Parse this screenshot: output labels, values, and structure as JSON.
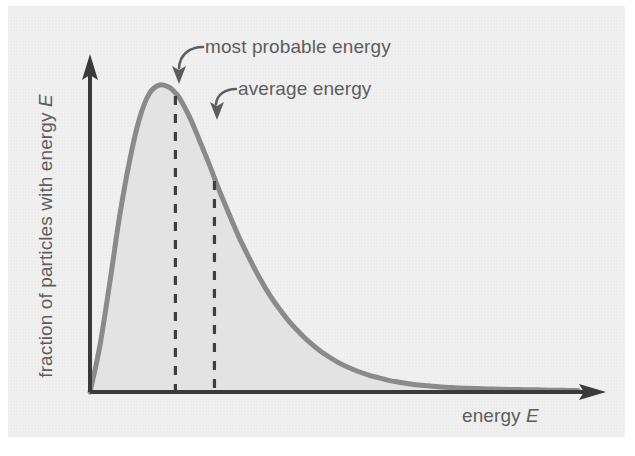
{
  "figure": {
    "kind": "maxwell-boltzmann-distribution-diagram",
    "background_color": "#eeeeee",
    "curve_color": "#8a8a8a",
    "fill_color": "#e3e3e3",
    "axis_color": "#3a3a3a",
    "annotation_color": "#5d5d5d",
    "dash_color": "#3f3f3f"
  },
  "axes": {
    "y_label_text": "fraction of particles with energy",
    "y_label_symbol": "E",
    "x_label_text": "energy",
    "x_label_symbol": "E",
    "y_arrow": "up-arrow-icon",
    "x_arrow": "right-arrow-icon"
  },
  "annotations": [
    {
      "id": "most-probable-energy",
      "label": "most probable energy",
      "arrow": "curved-leader-arrow-icon",
      "points_to": "peak-of-curve"
    },
    {
      "id": "average-energy",
      "label": "average energy",
      "arrow": "curved-leader-arrow-icon",
      "points_to": "average-energy-marker"
    }
  ],
  "markers": [
    {
      "id": "most-probable-marker",
      "style": "dashed-vertical-line"
    },
    {
      "id": "average-marker",
      "style": "dashed-vertical-line"
    }
  ],
  "chart_data": {
    "type": "line",
    "title": "",
    "xlabel": "energy E",
    "ylabel": "fraction of particles with energy E",
    "grid": false,
    "legend": "none",
    "axis_ticks": "none",
    "xlim": [
      0,
      1
    ],
    "ylim": [
      0,
      1
    ],
    "annotations": [
      {
        "text": "most probable energy",
        "x": 0.175,
        "y": 1.0
      },
      {
        "text": "average energy",
        "x": 0.255,
        "y": 0.92
      }
    ],
    "vlines": [
      {
        "name": "most probable energy",
        "x": 0.175
      },
      {
        "name": "average energy",
        "x": 0.255
      }
    ],
    "series": [
      {
        "name": "Maxwell-Boltzmann distribution",
        "x": [
          0.0,
          0.02,
          0.041,
          0.061,
          0.082,
          0.102,
          0.122,
          0.143,
          0.163,
          0.175,
          0.184,
          0.204,
          0.224,
          0.245,
          0.255,
          0.265,
          0.286,
          0.306,
          0.327,
          0.347,
          0.367,
          0.388,
          0.408,
          0.429,
          0.449,
          0.469,
          0.49,
          0.51,
          0.531,
          0.551,
          0.571,
          0.592,
          0.612,
          0.633,
          0.653,
          0.673,
          0.694,
          0.714,
          0.735,
          0.755,
          0.776,
          0.796,
          0.816,
          0.837,
          0.857,
          0.878,
          0.898,
          0.918,
          0.939,
          0.959,
          0.98,
          1.0
        ],
        "y": [
          0.0,
          0.148,
          0.361,
          0.576,
          0.76,
          0.894,
          0.973,
          1.0,
          0.992,
          0.974,
          0.956,
          0.896,
          0.821,
          0.739,
          0.697,
          0.656,
          0.576,
          0.502,
          0.434,
          0.373,
          0.319,
          0.271,
          0.23,
          0.194,
          0.163,
          0.137,
          0.114,
          0.095,
          0.079,
          0.066,
          0.055,
          0.046,
          0.038,
          0.032,
          0.027,
          0.023,
          0.02,
          0.017,
          0.015,
          0.013,
          0.012,
          0.011,
          0.01,
          0.009,
          0.008,
          0.008,
          0.007,
          0.007,
          0.006,
          0.006,
          0.005,
          0.005
        ],
        "filled": true
      }
    ]
  }
}
